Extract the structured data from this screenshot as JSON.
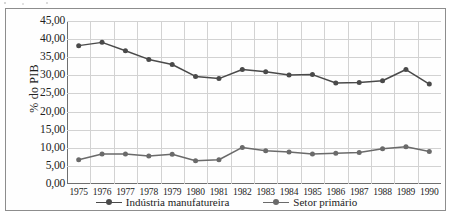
{
  "chart_data": {
    "type": "line",
    "title": "",
    "xlabel": "",
    "ylabel": "% do PIB",
    "ylim": [
      0,
      45
    ],
    "ytick_step": 5,
    "grid": true,
    "legend_position": "bottom",
    "x": [
      1975,
      1976,
      1977,
      1978,
      1979,
      1980,
      1981,
      1982,
      1983,
      1984,
      1985,
      1986,
      1987,
      1988,
      1989,
      1990
    ],
    "categories": [
      "1975",
      "1976",
      "1977",
      "1978",
      "1979",
      "1980",
      "1981",
      "1982",
      "1983",
      "1984",
      "1985",
      "1986",
      "1987",
      "1988",
      "1989",
      "1990"
    ],
    "ytick_labels": [
      "45,00",
      "40,00",
      "35,00",
      "30,00",
      "25,00",
      "20,00",
      "15,00",
      "10,00",
      "5,00",
      "0,00"
    ],
    "ytick_values": [
      45,
      40,
      35,
      30,
      25,
      20,
      15,
      10,
      5,
      0
    ],
    "series": [
      {
        "name": "Indústria manufatureira",
        "color": "#4a4a4a",
        "marker": "circle",
        "values": [
          38.2,
          39.1,
          36.8,
          34.4,
          33.0,
          29.7,
          29.1,
          31.6,
          31.0,
          30.1,
          30.2,
          27.9,
          28.0,
          28.5,
          31.6,
          27.6
        ]
      },
      {
        "name": "Setor primário",
        "color": "#6a6a6a",
        "marker": "circle",
        "values": [
          6.7,
          8.3,
          8.3,
          7.7,
          8.2,
          6.4,
          6.7,
          10.1,
          9.2,
          8.8,
          8.3,
          8.5,
          8.7,
          9.7,
          10.3,
          9.0
        ]
      }
    ]
  },
  "axes": {
    "y_title": "% do PIB"
  },
  "legend": {
    "items": [
      {
        "label": "Indústria manufatureira"
      },
      {
        "label": "Setor primário"
      }
    ]
  }
}
